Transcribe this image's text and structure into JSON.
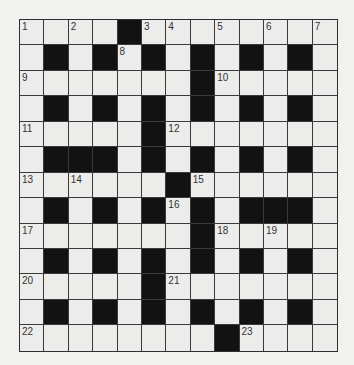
{
  "puzzle": {
    "rows": 13,
    "cols": 13,
    "colors": {
      "background": "#f1f1f0",
      "cell": "#ececeb",
      "block": "#121212",
      "grid_line": "#3a3a3a"
    },
    "grid": [
      ".....#.......",
      ".#.#.#.#.#.#.",
      ".......#.....",
      ".#.#.#.#.#.#.",
      ".....#.......",
      ".###.#.#.#.#.",
      "......#......",
      ".#.#.#.#.###.",
      ".......#.....",
      ".#.#.#.#.#.#.",
      ".....#.......",
      ".#.#.#.#.#.#.",
      "........#...."
    ],
    "grid_fix_note": "",
    "numbers": [
      {
        "r": 0,
        "c": 0,
        "n": "1"
      },
      {
        "r": 0,
        "c": 2,
        "n": "2"
      },
      {
        "r": 0,
        "c": 5,
        "n": "3"
      },
      {
        "r": 0,
        "c": 6,
        "n": "4"
      },
      {
        "r": 0,
        "c": 8,
        "n": "5"
      },
      {
        "r": 0,
        "c": 10,
        "n": "6"
      },
      {
        "r": 0,
        "c": 12,
        "n": "7"
      },
      {
        "r": 1,
        "c": 4,
        "n": "8"
      },
      {
        "r": 2,
        "c": 0,
        "n": "9"
      },
      {
        "r": 2,
        "c": 8,
        "n": "10"
      },
      {
        "r": 4,
        "c": 0,
        "n": "11"
      },
      {
        "r": 4,
        "c": 6,
        "n": "12"
      },
      {
        "r": 6,
        "c": 0,
        "n": "13"
      },
      {
        "r": 6,
        "c": 2,
        "n": "14"
      },
      {
        "r": 6,
        "c": 7,
        "n": "15"
      },
      {
        "r": 7,
        "c": 6,
        "n": "16"
      },
      {
        "r": 8,
        "c": 0,
        "n": "17"
      },
      {
        "r": 8,
        "c": 8,
        "n": "18"
      },
      {
        "r": 8,
        "c": 10,
        "n": "19"
      },
      {
        "r": 10,
        "c": 0,
        "n": "20"
      },
      {
        "r": 10,
        "c": 6,
        "n": "21"
      },
      {
        "r": 12,
        "c": 0,
        "n": "22"
      },
      {
        "r": 12,
        "c": 9,
        "n": "23"
      }
    ],
    "letters": []
  }
}
